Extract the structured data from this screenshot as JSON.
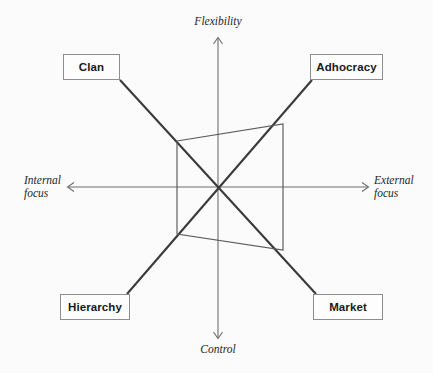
{
  "diagram": {
    "background_color": "#fbfbfb",
    "line_color": "#3a3a3a",
    "axis_color": "#6e6e6e",
    "box_border_color": "#8d8d8d",
    "profile_color": "#5a5a5a",
    "quadrants": [
      {
        "id": "clan",
        "label": "Clan",
        "position": "top-left"
      },
      {
        "id": "adhocracy",
        "label": "Adhocracy",
        "position": "top-right"
      },
      {
        "id": "hierarchy",
        "label": "Hierarchy",
        "position": "bottom-left"
      },
      {
        "id": "market",
        "label": "Market",
        "position": "bottom-right"
      }
    ],
    "axes": {
      "vertical": {
        "top_label": "Flexibility",
        "bottom_label": "Control"
      },
      "horizontal": {
        "left_label_line1": "Internal",
        "left_label_line2": "focus",
        "right_label_line1": "External",
        "right_label_line2": "focus"
      }
    },
    "center": {
      "x": 218,
      "y": 187
    },
    "profile_polygon": {
      "description": "Culture profile plotted across the four quadrants",
      "points": [
        {
          "quadrant": "clan",
          "x": 177,
          "y": 141
        },
        {
          "quadrant": "adhocracy",
          "x": 283,
          "y": 124
        },
        {
          "quadrant": "market",
          "x": 283,
          "y": 250
        },
        {
          "quadrant": "hierarchy",
          "x": 177,
          "y": 234
        }
      ]
    }
  }
}
